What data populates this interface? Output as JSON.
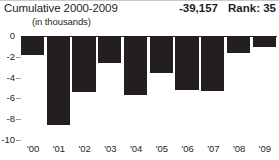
{
  "header": {
    "cumulative_title": "Cumulative 2000-2009",
    "cumulative_value": "-39,157",
    "rank_label": "Rank: 35",
    "units_label": "(in thousands)"
  },
  "chart_data": {
    "type": "bar",
    "title": "Cumulative 2000-2009",
    "subtitle": "(in thousands)",
    "xlabel": "",
    "ylabel": "",
    "categories": [
      "'00",
      "'01",
      "'02",
      "'03",
      "'04",
      "'05",
      "'06",
      "'07",
      "'08",
      "'09"
    ],
    "values": [
      -1.8,
      -8.6,
      -5.4,
      -2.6,
      -5.7,
      -3.6,
      -5.2,
      -5.3,
      -1.6,
      -1.1
    ],
    "ylim": [
      -10,
      0
    ],
    "yticks": [
      0,
      -2,
      -4,
      -6,
      -8,
      -10
    ],
    "ytick_labels": [
      "0",
      "-2",
      "-4",
      "-6",
      "-8",
      "-10"
    ],
    "grid": false,
    "legend": "none",
    "bar_color": "#231f20",
    "annotations": {
      "cumulative_total": "-39,157",
      "rank": "Rank: 35"
    }
  }
}
